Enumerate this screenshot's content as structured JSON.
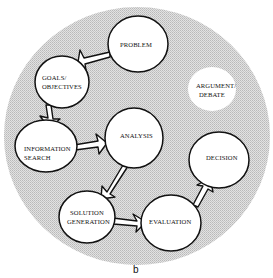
{
  "diagram": {
    "type": "process-cycle",
    "background_color": "#cfcfcf",
    "bubble_fill": "#ffffff",
    "stroke_color": "#111111",
    "caption": "b",
    "nodes": [
      {
        "id": "problem",
        "label_lines": [
          "PROBLEM"
        ]
      },
      {
        "id": "goals",
        "label_lines": [
          "GOALS/",
          "OBJECTIVES"
        ]
      },
      {
        "id": "argument",
        "label_lines": [
          "ARGUMENT/",
          "DEBATE"
        ]
      },
      {
        "id": "info",
        "label_lines": [
          "INFORMATION",
          "SEARCH"
        ]
      },
      {
        "id": "analysis",
        "label_lines": [
          "ANALYSIS"
        ]
      },
      {
        "id": "decision",
        "label_lines": [
          "DECISION"
        ]
      },
      {
        "id": "solution",
        "label_lines": [
          "SOLUTION",
          "GENERATION"
        ]
      },
      {
        "id": "evaluation",
        "label_lines": [
          "EVALUATION"
        ]
      }
    ],
    "edges": [
      {
        "from": "problem",
        "to": "goals"
      },
      {
        "from": "goals",
        "to": "info"
      },
      {
        "from": "info",
        "to": "analysis"
      },
      {
        "from": "analysis",
        "to": "solution"
      },
      {
        "from": "solution",
        "to": "evaluation"
      },
      {
        "from": "evaluation",
        "to": "decision"
      }
    ]
  }
}
